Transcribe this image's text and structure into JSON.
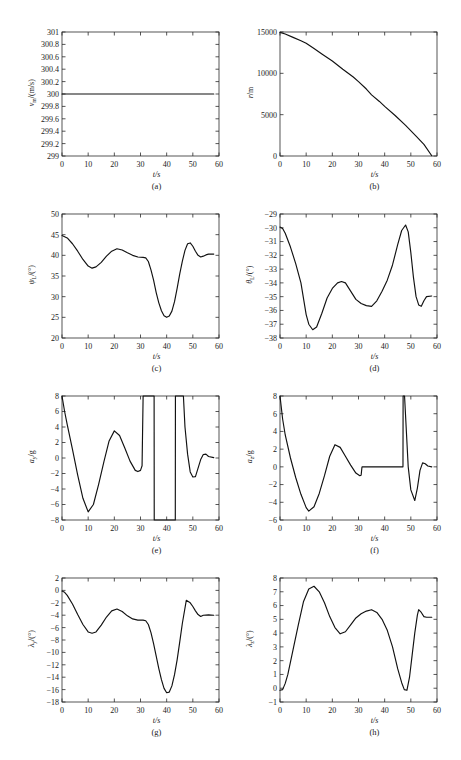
{
  "figure": {
    "background": "#ffffff",
    "axis_color": "#2b2b2b",
    "curve_color": "#111111",
    "xlabel": "t/s",
    "xlabel_symbol": "t",
    "xlabel_unit": "/s"
  },
  "panels": [
    {
      "caption": "(a)",
      "ylabel_main": "v",
      "ylabel_sub": "m",
      "ylabel_unit": "/(m/s)",
      "ylabel_full": "v_m/(m/s)"
    },
    {
      "caption": "(b)",
      "ylabel_main": "r",
      "ylabel_sub": "",
      "ylabel_unit": "/m",
      "ylabel_full": "r/m"
    },
    {
      "caption": "(c)",
      "ylabel_main": "ψ",
      "ylabel_sub": "L",
      "ylabel_unit": "/(°)",
      "ylabel_full": "ψ_L/(°)"
    },
    {
      "caption": "(d)",
      "ylabel_main": "θ",
      "ylabel_sub": "L",
      "ylabel_unit": "/(°)",
      "ylabel_full": "θ_L/(°)"
    },
    {
      "caption": "(e)",
      "ylabel_main": "a",
      "ylabel_sub": "y",
      "ylabel_unit": "/g",
      "ylabel_full": "a_y/g"
    },
    {
      "caption": "(f)",
      "ylabel_main": "a",
      "ylabel_sub": "z",
      "ylabel_unit": "/g",
      "ylabel_full": "a_z/g"
    },
    {
      "caption": "(g)",
      "ylabel_main": "λ",
      "ylabel_sub": "y",
      "ylabel_unit": "/(°)",
      "ylabel_full": "λ_y/(°)"
    },
    {
      "caption": "(h)",
      "ylabel_main": "λ",
      "ylabel_sub": "z",
      "ylabel_unit": "/(°)",
      "ylabel_full": "λ_z/(°)"
    }
  ],
  "chart_data": [
    {
      "id": "a",
      "type": "line",
      "title": "",
      "xlabel": "t/s",
      "ylabel": "v_m/(m/s)",
      "xlim": [
        0,
        60
      ],
      "ylim": [
        299,
        301
      ],
      "xticks": [
        0,
        10,
        20,
        30,
        40,
        50,
        60
      ],
      "yticks": [
        299,
        299.2,
        299.4,
        299.6,
        299.8,
        300,
        300.2,
        300.4,
        300.6,
        300.8,
        301
      ],
      "ytick_labels": [
        "299",
        "299.2",
        "299.4",
        "299.6",
        "299.8",
        "300",
        "300.2",
        "300.4",
        "300.6",
        "300.8",
        "301"
      ],
      "grid": false,
      "legend": null,
      "series": [
        {
          "name": "missile speed",
          "x": [
            0,
            10,
            20,
            30,
            40,
            50,
            58
          ],
          "y": [
            300,
            300,
            300,
            300,
            300,
            300,
            300
          ]
        }
      ]
    },
    {
      "id": "b",
      "type": "line",
      "title": "",
      "xlabel": "t/s",
      "ylabel": "r/m",
      "xlim": [
        0,
        60
      ],
      "ylim": [
        0,
        15000
      ],
      "xticks": [
        0,
        10,
        20,
        30,
        40,
        50,
        60
      ],
      "yticks": [
        0,
        5000,
        10000,
        15000
      ],
      "ytick_labels": [
        "0",
        "5000",
        "10000",
        "15000"
      ],
      "grid": false,
      "legend": null,
      "series": [
        {
          "name": "relative range",
          "x": [
            0,
            2,
            5,
            8,
            10,
            13,
            16,
            20,
            24,
            28,
            30,
            33,
            35,
            38,
            40,
            44,
            48,
            52,
            55,
            58
          ],
          "y": [
            14950,
            14750,
            14350,
            13950,
            13650,
            13000,
            12350,
            11500,
            10500,
            9550,
            9000,
            8100,
            7400,
            6600,
            6000,
            4900,
            3700,
            2400,
            1400,
            30
          ]
        }
      ]
    },
    {
      "id": "c",
      "type": "line",
      "title": "",
      "xlabel": "t/s",
      "ylabel": "ψ_L/(°)",
      "xlim": [
        0,
        60
      ],
      "ylim": [
        20,
        50
      ],
      "xticks": [
        0,
        10,
        20,
        30,
        40,
        50,
        60
      ],
      "yticks": [
        20,
        25,
        30,
        35,
        40,
        45,
        50
      ],
      "ytick_labels": [
        "20",
        "25",
        "30",
        "35",
        "40",
        "45",
        "50"
      ],
      "grid": false,
      "legend": null,
      "series": [
        {
          "name": "LOS azimuth angle",
          "x": [
            0,
            2,
            4,
            6,
            8,
            10,
            11.5,
            13,
            15,
            17,
            19,
            21,
            23,
            25,
            27,
            29,
            31,
            32,
            33,
            34,
            35,
            36,
            37,
            38,
            39,
            40,
            41,
            42,
            43,
            44,
            45,
            46,
            47,
            48,
            49,
            50,
            51,
            52,
            53,
            54,
            55,
            56,
            58
          ],
          "y": [
            44.8,
            44.2,
            42.8,
            41.0,
            39.0,
            37.4,
            36.9,
            37.2,
            38.3,
            39.8,
            41.0,
            41.6,
            41.3,
            40.6,
            40.0,
            39.6,
            39.5,
            39.4,
            38.5,
            36.5,
            34.0,
            31.0,
            28.5,
            26.6,
            25.4,
            25.0,
            25.3,
            26.5,
            28.8,
            32.0,
            35.5,
            38.6,
            41.2,
            42.8,
            43.0,
            42.2,
            41.0,
            40.0,
            39.6,
            39.8,
            40.1,
            40.3,
            40.3
          ]
        }
      ]
    },
    {
      "id": "d",
      "type": "line",
      "title": "",
      "xlabel": "t/s",
      "ylabel": "θ_L/(°)",
      "xlim": [
        0,
        60
      ],
      "ylim": [
        -38,
        -29
      ],
      "xticks": [
        0,
        10,
        20,
        30,
        40,
        50,
        60
      ],
      "yticks": [
        -38,
        -37,
        -36,
        -35,
        -34,
        -33,
        -32,
        -31,
        -30,
        -29
      ],
      "ytick_labels": [
        "-38",
        "-37",
        "-36",
        "-35",
        "-34",
        "-33",
        "-32",
        "-31",
        "-30",
        "-29"
      ],
      "grid": false,
      "legend": null,
      "series": [
        {
          "name": "LOS elevation angle",
          "x": [
            0,
            1,
            2,
            4,
            6,
            8,
            10,
            11,
            12.5,
            14,
            16,
            18,
            20,
            22,
            23.5,
            25,
            27,
            29,
            31,
            33,
            35,
            37,
            39,
            41,
            43,
            45,
            46.5,
            48,
            49,
            50,
            51,
            52,
            53,
            54,
            55,
            56,
            58
          ],
          "y": [
            -29.95,
            -30.05,
            -30.4,
            -31.4,
            -32.6,
            -34.0,
            -36.3,
            -37.0,
            -37.4,
            -37.2,
            -36.2,
            -35.1,
            -34.4,
            -34.0,
            -33.9,
            -34.0,
            -34.6,
            -35.2,
            -35.5,
            -35.65,
            -35.7,
            -35.3,
            -34.6,
            -33.8,
            -32.7,
            -31.2,
            -30.2,
            -29.8,
            -30.3,
            -31.8,
            -33.6,
            -35.0,
            -35.6,
            -35.7,
            -35.3,
            -35.0,
            -34.95
          ]
        }
      ]
    },
    {
      "id": "e",
      "type": "line",
      "title": "",
      "xlabel": "t/s",
      "ylabel": "a_y/g",
      "xlim": [
        0,
        60
      ],
      "ylim": [
        -8,
        8
      ],
      "xticks": [
        0,
        10,
        20,
        30,
        40,
        50,
        60
      ],
      "yticks": [
        -8,
        -6,
        -4,
        -2,
        0,
        2,
        4,
        6,
        8
      ],
      "ytick_labels": [
        "-8",
        "-6",
        "-4",
        "-2",
        "0",
        "2",
        "4",
        "6",
        "8"
      ],
      "grid": false,
      "legend": null,
      "note": "saturating lateral acceleration command with limits at +/-8 g",
      "series": [
        {
          "name": "lateral acceleration ay/g",
          "x": [
            0,
            1,
            2,
            4,
            6,
            8,
            10,
            12,
            14,
            16,
            18,
            20,
            22,
            24,
            26,
            28,
            29,
            30,
            30.6,
            31,
            31.05,
            35.2,
            35.25,
            43.3,
            43.35,
            46.4,
            47,
            48,
            49,
            50,
            51,
            52,
            53,
            54,
            55,
            56,
            58
          ],
          "y": [
            8,
            6.0,
            4.3,
            1.1,
            -2.2,
            -5.2,
            -6.95,
            -6.0,
            -3.4,
            -0.5,
            2.2,
            3.5,
            2.9,
            1.3,
            -0.4,
            -1.6,
            -1.75,
            -1.6,
            -1.0,
            8,
            8,
            8,
            -8,
            -8,
            8,
            8,
            4.0,
            0.5,
            -1.8,
            -2.45,
            -2.4,
            -1.3,
            -0.2,
            0.45,
            0.5,
            0.2,
            0.05
          ]
        }
      ]
    },
    {
      "id": "f",
      "type": "line",
      "title": "",
      "xlabel": "t/s",
      "ylabel": "a_z/g",
      "xlim": [
        0,
        60
      ],
      "ylim": [
        -6,
        8
      ],
      "xticks": [
        0,
        10,
        20,
        30,
        40,
        50,
        60
      ],
      "yticks": [
        -6,
        -4,
        -2,
        0,
        2,
        4,
        6,
        8
      ],
      "ytick_labels": [
        "-6",
        "-4",
        "-2",
        "0",
        "2",
        "4",
        "6",
        "8"
      ],
      "grid": false,
      "legend": null,
      "note": "normal acceleration command, saturates at +8 g near t=47 s",
      "series": [
        {
          "name": "normal acceleration az/g",
          "x": [
            0,
            1,
            2,
            4,
            6,
            8,
            10,
            11,
            13,
            15,
            17,
            19,
            21,
            23,
            25,
            27,
            29,
            30.5,
            31,
            31.3,
            31.35,
            47,
            47.05,
            47.6,
            48.3,
            49,
            50,
            51.5,
            52.5,
            53.5,
            54.5,
            55.5,
            56.5,
            58
          ],
          "y": [
            8,
            5.4,
            3.6,
            1.0,
            -1.2,
            -3.1,
            -4.6,
            -5.0,
            -4.5,
            -3.0,
            -1.0,
            1.2,
            2.5,
            2.2,
            1.2,
            0.2,
            -0.7,
            -1.0,
            -0.95,
            -0.1,
            0,
            0,
            8,
            8,
            4.0,
            0.0,
            -2.6,
            -3.8,
            -2.4,
            -0.4,
            0.45,
            0.35,
            0.1,
            0.0
          ]
        }
      ]
    },
    {
      "id": "g",
      "type": "line",
      "title": "",
      "xlabel": "t/s",
      "ylabel": "λ_y/(°)",
      "xlim": [
        0,
        60
      ],
      "ylim": [
        -18,
        2
      ],
      "xticks": [
        0,
        10,
        20,
        30,
        40,
        50,
        60
      ],
      "yticks": [
        -18,
        -16,
        -14,
        -12,
        -10,
        -8,
        -6,
        -4,
        -2,
        0,
        2
      ],
      "ytick_labels": [
        "-18",
        "-16",
        "-14",
        "-12",
        "-10",
        "-8",
        "-6",
        "-4",
        "-2",
        "0",
        "2"
      ],
      "grid": false,
      "legend": null,
      "series": [
        {
          "name": "look angle lambda_y",
          "x": [
            0,
            1,
            2,
            4,
            6,
            8,
            10,
            11.5,
            13,
            15,
            17,
            19,
            21,
            23,
            25,
            27,
            29,
            31,
            32,
            33,
            34,
            35,
            36,
            37,
            38,
            39,
            40,
            41,
            42,
            43,
            44,
            45,
            46,
            47.5,
            49,
            50,
            51,
            52,
            53,
            54,
            56,
            58
          ],
          "y": [
            -0.1,
            -0.3,
            -0.8,
            -2.2,
            -3.9,
            -5.5,
            -6.7,
            -6.9,
            -6.7,
            -5.6,
            -4.3,
            -3.3,
            -3.0,
            -3.4,
            -4.1,
            -4.6,
            -4.8,
            -4.8,
            -4.9,
            -5.5,
            -6.8,
            -8.6,
            -10.6,
            -12.6,
            -14.4,
            -15.8,
            -16.5,
            -16.4,
            -15.4,
            -13.6,
            -11.2,
            -8.3,
            -5.3,
            -1.6,
            -2.0,
            -2.6,
            -3.3,
            -3.9,
            -4.2,
            -4.0,
            -3.95,
            -4.0
          ]
        }
      ]
    },
    {
      "id": "h",
      "type": "line",
      "title": "",
      "xlabel": "t/s",
      "ylabel": "λ_z/(°)",
      "xlim": [
        0,
        60
      ],
      "ylim": [
        -1,
        8
      ],
      "xticks": [
        0,
        10,
        20,
        30,
        40,
        50,
        60
      ],
      "yticks": [
        -1,
        0,
        1,
        2,
        3,
        4,
        5,
        6,
        7,
        8
      ],
      "ytick_labels": [
        "-1",
        "0",
        "1",
        "2",
        "3",
        "4",
        "5",
        "6",
        "7",
        "8"
      ],
      "grid": false,
      "legend": null,
      "series": [
        {
          "name": "look angle lambda_z",
          "x": [
            0,
            1,
            2,
            3,
            5,
            7,
            9,
            11,
            13,
            15,
            17,
            19,
            21,
            23,
            25,
            27,
            29,
            31,
            33,
            35,
            37,
            39,
            41,
            43,
            45,
            46.5,
            47.5,
            48.5,
            49.5,
            50.5,
            51.5,
            52.5,
            53,
            54,
            55,
            56,
            58
          ],
          "y": [
            -0.15,
            -0.1,
            0.35,
            1.0,
            2.8,
            4.6,
            6.3,
            7.2,
            7.4,
            7.0,
            6.2,
            5.2,
            4.4,
            3.95,
            4.1,
            4.6,
            5.1,
            5.4,
            5.6,
            5.7,
            5.5,
            5.0,
            4.2,
            3.0,
            1.4,
            0.4,
            -0.1,
            -0.15,
            0.8,
            2.4,
            4.0,
            5.3,
            5.7,
            5.5,
            5.2,
            5.15,
            5.15
          ]
        }
      ]
    }
  ]
}
